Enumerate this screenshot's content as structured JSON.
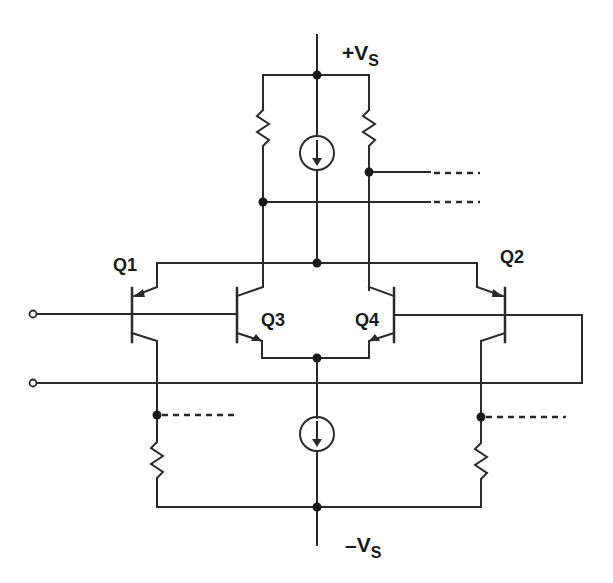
{
  "diagram": {
    "type": "circuit-schematic",
    "colors": {
      "wire": "#2a2a2a",
      "background": "#ffffff"
    },
    "labels": {
      "vplus": {
        "main": "+V",
        "sub": "S"
      },
      "vminus": {
        "main": "–V",
        "sub": "S"
      },
      "q1": "Q1",
      "q2": "Q2",
      "q3": "Q3",
      "q4": "Q4"
    },
    "components": [
      {
        "id": "Q1",
        "kind": "pnp-transistor"
      },
      {
        "id": "Q2",
        "kind": "pnp-transistor"
      },
      {
        "id": "Q3",
        "kind": "npn-transistor"
      },
      {
        "id": "Q4",
        "kind": "npn-transistor"
      },
      {
        "id": "R_top_left",
        "kind": "resistor"
      },
      {
        "id": "R_top_right",
        "kind": "resistor"
      },
      {
        "id": "R_bottom_left",
        "kind": "resistor"
      },
      {
        "id": "R_bottom_right",
        "kind": "resistor"
      },
      {
        "id": "I_top",
        "kind": "current-source"
      },
      {
        "id": "I_bottom",
        "kind": "current-source"
      },
      {
        "id": "IN_plus",
        "kind": "input-terminal"
      },
      {
        "id": "IN_minus",
        "kind": "input-terminal"
      }
    ]
  }
}
